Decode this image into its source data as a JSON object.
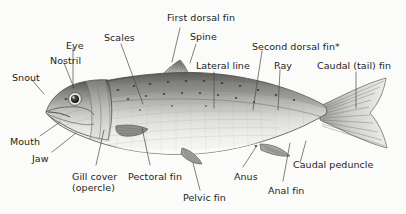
{
  "diagram": {
    "background_color": "#fbfbf9",
    "label_color": "#1d1d1b",
    "leader_color": "#4a4a48",
    "footnote_marker": "*"
  },
  "labels": [
    {
      "id": "snout",
      "text": "Snout",
      "x": 12,
      "y": 72,
      "anchor": "start"
    },
    {
      "id": "nostril",
      "text": "Nostril",
      "x": 50,
      "y": 55,
      "anchor": "start"
    },
    {
      "id": "eye",
      "text": "Eye",
      "x": 66,
      "y": 40,
      "anchor": "start"
    },
    {
      "id": "scales",
      "text": "Scales",
      "x": 104,
      "y": 32,
      "anchor": "start"
    },
    {
      "id": "first-dorsal-fin",
      "text": "First dorsal fin",
      "x": 167,
      "y": 12,
      "anchor": "start"
    },
    {
      "id": "spine",
      "text": "Spine",
      "x": 190,
      "y": 31,
      "anchor": "start"
    },
    {
      "id": "lateral-line",
      "text": "Lateral line",
      "x": 196,
      "y": 60,
      "anchor": "start"
    },
    {
      "id": "second-dorsal-fin",
      "text": "Second dorsal fin*",
      "x": 252,
      "y": 41,
      "anchor": "start"
    },
    {
      "id": "ray",
      "text": "Ray",
      "x": 274,
      "y": 60,
      "anchor": "start"
    },
    {
      "id": "caudal-tail-fin",
      "text": "Caudal (tail) fin",
      "x": 317,
      "y": 60,
      "anchor": "start"
    },
    {
      "id": "mouth",
      "text": "Mouth",
      "x": 10,
      "y": 136,
      "anchor": "start"
    },
    {
      "id": "jaw",
      "text": "Jaw",
      "x": 32,
      "y": 153,
      "anchor": "start"
    },
    {
      "id": "gill-cover",
      "text": "Gill cover\n(opercle)",
      "x": 72,
      "y": 171,
      "anchor": "start"
    },
    {
      "id": "pectoral-fin",
      "text": "Pectoral fin",
      "x": 128,
      "y": 171,
      "anchor": "start"
    },
    {
      "id": "pelvic-fin",
      "text": "Pelvic fin",
      "x": 183,
      "y": 192,
      "anchor": "start"
    },
    {
      "id": "anus",
      "text": "Anus",
      "x": 234,
      "y": 171,
      "anchor": "start"
    },
    {
      "id": "anal-fin",
      "text": "Anal fin",
      "x": 268,
      "y": 185,
      "anchor": "start"
    },
    {
      "id": "caudal-peduncle",
      "text": "Caudal peduncle",
      "x": 293,
      "y": 159,
      "anchor": "start"
    }
  ],
  "leaders": [
    {
      "id": "leader-snout",
      "points": "32,80 44,94"
    },
    {
      "id": "leader-nostril",
      "points": "64,63 74,88"
    },
    {
      "id": "leader-eye",
      "points": "73,48 73,88"
    },
    {
      "id": "leader-scales",
      "points": "121,44 143,104"
    },
    {
      "id": "leader-first-dorsal-fin",
      "points": "180,28 172,62"
    },
    {
      "id": "leader-spine",
      "points": "196,44 190,63"
    },
    {
      "id": "leader-lateral-line",
      "points": "214,72 214,108"
    },
    {
      "id": "leader-second-dorsal-fin",
      "points": "262,51 253,110"
    },
    {
      "id": "leader-ray",
      "points": "280,70 278,110"
    },
    {
      "id": "leader-caudal-tail-fin",
      "points": "356,72 356,108"
    },
    {
      "id": "leader-mouth",
      "points": "40,136 60,122"
    },
    {
      "id": "leader-jaw",
      "points": "52,152 76,133"
    },
    {
      "id": "leader-gill-cover",
      "points": "96,165 104,130"
    },
    {
      "id": "leader-pectoral-fin",
      "points": "150,165 142,128"
    },
    {
      "id": "leader-pelvic-fin",
      "points": "200,190 193,163"
    },
    {
      "id": "leader-anus",
      "points": "243,167 256,147"
    },
    {
      "id": "leader-anal-fin",
      "points": "283,181 290,143"
    },
    {
      "id": "leader-caudal-peduncle",
      "points": "300,163 306,141"
    }
  ],
  "chart_data": {
    "type": "diagram",
    "parts": [
      "Snout",
      "Nostril",
      "Eye",
      "Scales",
      "First dorsal fin",
      "Spine",
      "Lateral line",
      "Second dorsal fin*",
      "Ray",
      "Caudal (tail) fin",
      "Mouth",
      "Jaw",
      "Gill cover (opercle)",
      "Pectoral fin",
      "Pelvic fin",
      "Anus",
      "Anal fin",
      "Caudal peduncle"
    ],
    "part_count": 18,
    "orientation": "lateral view, head facing left",
    "style": "grayscale pencil illustration"
  }
}
